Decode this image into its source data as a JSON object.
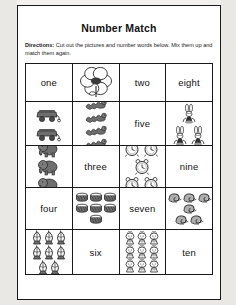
{
  "worksheet": {
    "title": "Number Match",
    "directions_label": "Directions:",
    "directions_text": " Cut out the pictures and number words below. Mix them up and match them again."
  },
  "colors": {
    "paper": "#ffffff",
    "background": "#f2f1ee",
    "ink": "#1a1a1a",
    "art": "#6e6e6e"
  },
  "grid": {
    "columns": 4,
    "rows": 5,
    "cells": [
      [
        {
          "kind": "word",
          "text": "one",
          "name": "cell-word-one"
        },
        {
          "kind": "picture",
          "icon": "flower-icon",
          "count": 1,
          "cols": 1,
          "name": "cell-picture-flower"
        },
        {
          "kind": "word",
          "text": "two",
          "name": "cell-word-two"
        },
        {
          "kind": "word",
          "text": "eight",
          "name": "cell-word-eight"
        }
      ],
      [
        {
          "kind": "picture",
          "icon": "wagon-icon",
          "count": 2,
          "cols": 1,
          "name": "cell-picture-wagons"
        },
        {
          "kind": "picture",
          "icon": "caterpillar-icon",
          "count": 4,
          "cols": 2,
          "name": "cell-picture-caterpillars"
        },
        {
          "kind": "word",
          "text": "five",
          "name": "cell-word-five"
        },
        {
          "kind": "picture",
          "icon": "bunny-icon",
          "count": 6,
          "cols": 3,
          "name": "cell-picture-bunnies"
        }
      ],
      [
        {
          "kind": "picture",
          "icon": "elephant-icon",
          "count": 3,
          "cols": 2,
          "name": "cell-picture-elephants"
        },
        {
          "kind": "word",
          "text": "three",
          "name": "cell-word-three"
        },
        {
          "kind": "picture",
          "icon": "clock-icon",
          "count": 5,
          "cols": 3,
          "name": "cell-picture-clocks"
        },
        {
          "kind": "word",
          "text": "nine",
          "name": "cell-word-nine"
        }
      ],
      [
        {
          "kind": "word",
          "text": "four",
          "name": "cell-word-four"
        },
        {
          "kind": "picture",
          "icon": "drum-icon",
          "count": 7,
          "cols": 3,
          "name": "cell-picture-drums"
        },
        {
          "kind": "word",
          "text": "seven",
          "name": "cell-word-seven"
        },
        {
          "kind": "picture",
          "icon": "snail-icon",
          "count": 6,
          "cols": 4,
          "name": "cell-picture-snails"
        }
      ],
      [
        {
          "kind": "picture",
          "icon": "lantern-icon",
          "count": 8,
          "cols": 3,
          "name": "cell-picture-lanterns"
        },
        {
          "kind": "word",
          "text": "six",
          "name": "cell-word-six"
        },
        {
          "kind": "picture",
          "icon": "chick-icon",
          "count": 9,
          "cols": 3,
          "name": "cell-picture-chicks"
        },
        {
          "kind": "word",
          "text": "ten",
          "name": "cell-word-ten"
        }
      ]
    ]
  }
}
